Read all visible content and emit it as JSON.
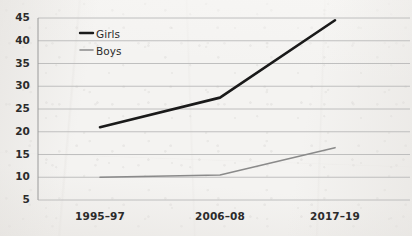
{
  "chart_data": {
    "type": "line",
    "title": "",
    "subtitle": "",
    "xlabel": "",
    "ylabel": "",
    "categories": [
      "1995–97",
      "2006–08",
      "2017–19"
    ],
    "series": [
      {
        "name": "Girls",
        "values": [
          21,
          27.5,
          44.5
        ],
        "color": "#1a1a1a",
        "width": 2.6
      },
      {
        "name": "Boys",
        "values": [
          10,
          10.5,
          16.5
        ],
        "color": "#8a8a8a",
        "width": 1.6
      }
    ],
    "ylim": [
      5,
      45
    ],
    "yticks": [
      5,
      10,
      15,
      20,
      25,
      30,
      35,
      40,
      45
    ],
    "ytick_labels": [
      "5",
      "10",
      "15",
      "20",
      "25",
      "30",
      "35",
      "40",
      "45"
    ],
    "grid": true,
    "grid_color": "#b9b9b9",
    "legend_position": "top-left-inside",
    "legend": [
      {
        "label": "Girls",
        "marker": "line-dash",
        "color": "#1a1a1a"
      },
      {
        "label": "Boys",
        "marker": "line-dash",
        "color": "#8a8a8a"
      }
    ],
    "axis_color": "#9a9a9a",
    "background": "#f4f3f1"
  },
  "axes": {
    "y_labels": [
      "45",
      "40",
      "35",
      "30",
      "25",
      "20",
      "15",
      "10",
      "5"
    ],
    "x_labels": [
      "1995–97",
      "2006–08",
      "2017–19"
    ]
  },
  "legend": {
    "girls_label": "Girls",
    "boys_label": "Boys"
  }
}
